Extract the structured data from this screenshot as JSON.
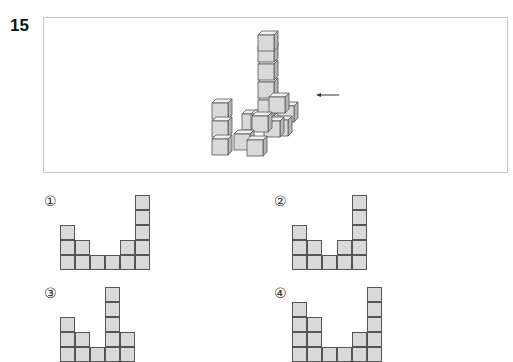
{
  "question": {
    "number": "15",
    "figure": {
      "description": "isometric stack of unit cubes with tall column, viewed direction indicated by arrow",
      "arrow_direction": "left",
      "colors": {
        "cube_face": "#d9d9d9",
        "cube_top": "#f2f2f2",
        "cube_side": "#b5b5b5",
        "edge": "#555555"
      }
    },
    "options": [
      {
        "label": "①",
        "column_heights": [
          3,
          2,
          1,
          1,
          2,
          5
        ]
      },
      {
        "label": "②",
        "column_heights": [
          3,
          2,
          1,
          2,
          5
        ]
      },
      {
        "label": "③",
        "column_heights": [
          3,
          2,
          1,
          5,
          2
        ]
      },
      {
        "label": "④",
        "column_heights": [
          4,
          3,
          1,
          1,
          2,
          5
        ]
      }
    ]
  }
}
